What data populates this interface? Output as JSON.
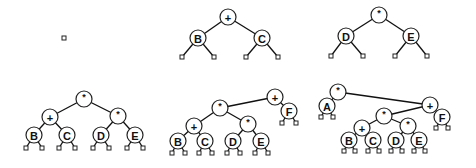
{
  "diagram": {
    "node_radius": 8,
    "leaf_size": 4,
    "panels": [
      {
        "id": "panel-1",
        "nodes": [],
        "edges": [],
        "leaves": [
          [
            64,
            38
          ]
        ]
      },
      {
        "id": "panel-2",
        "nodes": [
          {
            "id": "p2-plus",
            "label": "+",
            "x": 228,
            "y": 17
          },
          {
            "id": "p2-B",
            "label": "B",
            "x": 198,
            "y": 38
          },
          {
            "id": "p2-C",
            "label": "C",
            "x": 262,
            "y": 38
          }
        ],
        "edges": [
          [
            "p2-plus",
            "p2-B"
          ],
          [
            "p2-plus",
            "p2-C"
          ]
        ],
        "leaf_edges": [
          [
            "p2-B",
            182,
            57
          ],
          [
            "p2-B",
            214,
            57
          ],
          [
            "p2-C",
            246,
            57
          ],
          [
            "p2-C",
            278,
            57
          ]
        ]
      },
      {
        "id": "panel-3",
        "nodes": [
          {
            "id": "p3-times",
            "label": "*",
            "x": 379,
            "y": 15
          },
          {
            "id": "p3-D",
            "label": "D",
            "x": 346,
            "y": 36
          },
          {
            "id": "p3-E",
            "label": "E",
            "x": 411,
            "y": 36
          }
        ],
        "edges": [
          [
            "p3-times",
            "p3-D"
          ],
          [
            "p3-times",
            "p3-E"
          ]
        ],
        "leaf_edges": [
          [
            "p3-D",
            331,
            56
          ],
          [
            "p3-D",
            363,
            56
          ],
          [
            "p3-E",
            395,
            56
          ],
          [
            "p3-E",
            427,
            56
          ]
        ]
      },
      {
        "id": "panel-4",
        "nodes": [
          {
            "id": "p4-root",
            "label": "*",
            "x": 84,
            "y": 99
          },
          {
            "id": "p4-plus",
            "label": "+",
            "x": 50,
            "y": 117
          },
          {
            "id": "p4-times",
            "label": "*",
            "x": 118,
            "y": 116
          },
          {
            "id": "p4-B",
            "label": "B",
            "x": 34,
            "y": 135
          },
          {
            "id": "p4-C",
            "label": "C",
            "x": 67,
            "y": 135
          },
          {
            "id": "p4-D",
            "label": "D",
            "x": 101,
            "y": 135
          },
          {
            "id": "p4-E",
            "label": "E",
            "x": 135,
            "y": 135
          }
        ],
        "edges": [
          [
            "p4-root",
            "p4-plus"
          ],
          [
            "p4-root",
            "p4-times"
          ],
          [
            "p4-plus",
            "p4-B"
          ],
          [
            "p4-plus",
            "p4-C"
          ],
          [
            "p4-times",
            "p4-D"
          ],
          [
            "p4-times",
            "p4-E"
          ]
        ],
        "leaf_edges": [
          [
            "p4-B",
            26,
            148
          ],
          [
            "p4-B",
            42,
            148
          ],
          [
            "p4-C",
            59,
            148
          ],
          [
            "p4-C",
            75,
            148
          ],
          [
            "p4-D",
            93,
            148
          ],
          [
            "p4-D",
            109,
            148
          ],
          [
            "p4-E",
            127,
            148
          ],
          [
            "p4-E",
            143,
            148
          ]
        ]
      },
      {
        "id": "panel-5",
        "nodes": [
          {
            "id": "p5-root",
            "label": "+",
            "x": 275,
            "y": 97
          },
          {
            "id": "p5-times",
            "label": "*",
            "x": 220,
            "y": 108
          },
          {
            "id": "p5-F",
            "label": "F",
            "x": 289,
            "y": 111
          },
          {
            "id": "p5-plus",
            "label": "+",
            "x": 194,
            "y": 126
          },
          {
            "id": "p5-times2",
            "label": "*",
            "x": 248,
            "y": 124
          },
          {
            "id": "p5-B",
            "label": "B",
            "x": 178,
            "y": 141
          },
          {
            "id": "p5-C",
            "label": "C",
            "x": 205,
            "y": 141
          },
          {
            "id": "p5-D",
            "label": "D",
            "x": 233,
            "y": 141
          },
          {
            "id": "p5-E",
            "label": "E",
            "x": 261,
            "y": 141
          }
        ],
        "edges": [
          [
            "p5-root",
            "p5-times"
          ],
          [
            "p5-root",
            "p5-F"
          ],
          [
            "p5-times",
            "p5-plus"
          ],
          [
            "p5-times",
            "p5-times2"
          ],
          [
            "p5-plus",
            "p5-B"
          ],
          [
            "p5-plus",
            "p5-C"
          ],
          [
            "p5-times2",
            "p5-D"
          ],
          [
            "p5-times2",
            "p5-E"
          ]
        ],
        "leaf_edges": [
          [
            "p5-F",
            282,
            123
          ],
          [
            "p5-F",
            296,
            123
          ],
          [
            "p5-B",
            172,
            153
          ],
          [
            "p5-B",
            185,
            153
          ],
          [
            "p5-C",
            199,
            153
          ],
          [
            "p5-C",
            212,
            153
          ],
          [
            "p5-D",
            227,
            153
          ],
          [
            "p5-D",
            240,
            153
          ],
          [
            "p5-E",
            255,
            153
          ],
          [
            "p5-E",
            268,
            153
          ]
        ]
      },
      {
        "id": "panel-6",
        "nodes": [
          {
            "id": "p6-root",
            "label": "*",
            "x": 338,
            "y": 92
          },
          {
            "id": "p6-A",
            "label": "A",
            "x": 327,
            "y": 106
          },
          {
            "id": "p6-plus",
            "label": "+",
            "x": 430,
            "y": 105
          },
          {
            "id": "p6-F",
            "label": "F",
            "x": 442,
            "y": 117
          },
          {
            "id": "p6-times",
            "label": "*",
            "x": 384,
            "y": 116
          },
          {
            "id": "p6-plus2",
            "label": "+",
            "x": 362,
            "y": 128
          },
          {
            "id": "p6-times2",
            "label": "*",
            "x": 408,
            "y": 126
          },
          {
            "id": "p6-B",
            "label": "B",
            "x": 349,
            "y": 140
          },
          {
            "id": "p6-C",
            "label": "C",
            "x": 373,
            "y": 140
          },
          {
            "id": "p6-D",
            "label": "D",
            "x": 396,
            "y": 140
          },
          {
            "id": "p6-E",
            "label": "E",
            "x": 419,
            "y": 140
          }
        ],
        "edges": [
          [
            "p6-root",
            "p6-A"
          ],
          [
            "p6-root",
            "p6-plus"
          ],
          [
            "p6-plus",
            "p6-times"
          ],
          [
            "p6-plus",
            "p6-F"
          ],
          [
            "p6-times",
            "p6-plus2"
          ],
          [
            "p6-times",
            "p6-times2"
          ],
          [
            "p6-plus2",
            "p6-B"
          ],
          [
            "p6-plus2",
            "p6-C"
          ],
          [
            "p6-times2",
            "p6-D"
          ],
          [
            "p6-times2",
            "p6-E"
          ]
        ],
        "leaf_edges": [
          [
            "p6-A",
            321,
            117
          ],
          [
            "p6-A",
            333,
            117
          ],
          [
            "p6-F",
            436,
            128
          ],
          [
            "p6-F",
            448,
            128
          ],
          [
            "p6-B",
            344,
            151
          ],
          [
            "p6-B",
            355,
            151
          ],
          [
            "p6-C",
            368,
            151
          ],
          [
            "p6-C",
            379,
            151
          ],
          [
            "p6-D",
            391,
            151
          ],
          [
            "p6-D",
            402,
            151
          ],
          [
            "p6-E",
            414,
            151
          ],
          [
            "p6-E",
            425,
            151
          ]
        ]
      }
    ]
  }
}
